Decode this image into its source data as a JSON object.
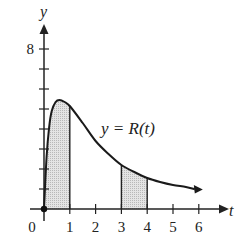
{
  "chart_data": {
    "type": "line",
    "title": "",
    "xlabel": "t",
    "ylabel": "y",
    "curve_label": "y = R(t)",
    "x_ticks": [
      "0",
      "1",
      "2",
      "3",
      "4",
      "5",
      "6"
    ],
    "y_ticks_labeled": [
      "8"
    ],
    "y_tick_count": 8,
    "xlim": [
      0,
      6.9
    ],
    "ylim": [
      0,
      9.2
    ],
    "grid": false,
    "series": [
      {
        "name": "R(t)",
        "x": [
          0,
          0.1,
          0.2,
          0.3,
          0.45,
          0.6,
          0.8,
          1.0,
          1.5,
          2.0,
          2.5,
          3.0,
          3.5,
          4.0,
          4.5,
          5.0,
          5.5,
          6.0
        ],
        "values": [
          0,
          2.6,
          4.1,
          4.9,
          5.35,
          5.45,
          5.35,
          5.15,
          4.3,
          3.4,
          2.75,
          2.2,
          1.85,
          1.55,
          1.35,
          1.2,
          1.1,
          1.0
        ]
      }
    ],
    "shaded_regions": [
      {
        "from": 0,
        "to": 1
      },
      {
        "from": 3,
        "to": 4
      }
    ],
    "point_at_origin": true
  },
  "colors": {
    "axis": "#222222",
    "curve": "#1a1a1a",
    "shade": "#d9d9d9"
  }
}
